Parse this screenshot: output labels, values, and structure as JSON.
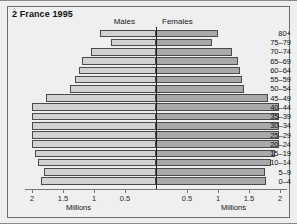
{
  "figure": {
    "title": "2 France 1995",
    "legend": {
      "left": "Males",
      "right": "Females"
    }
  },
  "chart_data": {
    "type": "bar",
    "subtype": "population-pyramid",
    "title": "2 France 1995",
    "xlabel": "Millions",
    "ylabel": "",
    "categories": [
      "0-4",
      "5-9",
      "10-14",
      "15-19",
      "20-24",
      "25-29",
      "30-34",
      "35-39",
      "40-44",
      "45-49",
      "50-54",
      "55-59",
      "60-64",
      "65-69",
      "70-74",
      "75-79",
      "80+"
    ],
    "series": [
      {
        "name": "Males",
        "direction": "left",
        "color": "#d2d2d2",
        "values": [
          1.85,
          1.8,
          1.9,
          1.95,
          2.0,
          2.0,
          2.0,
          2.0,
          2.0,
          1.78,
          1.38,
          1.3,
          1.25,
          1.2,
          1.05,
          0.72,
          0.9
        ]
      },
      {
        "name": "Females",
        "direction": "right",
        "color": "#a9a9a9",
        "values": [
          1.78,
          1.75,
          1.85,
          1.92,
          1.98,
          1.98,
          1.98,
          1.98,
          1.98,
          1.8,
          1.42,
          1.38,
          1.35,
          1.32,
          1.22,
          0.9,
          1.0
        ]
      }
    ],
    "xlim": [
      0,
      2.2
    ],
    "xticks": [
      0.5,
      1,
      1.5,
      2
    ],
    "xticklabels": [
      "0.5",
      "1",
      "1.5",
      "2"
    ],
    "grid": false,
    "legend_position": "top-center"
  },
  "axis": {
    "left_ticks": [
      "2",
      "1.5",
      "1",
      "0.5"
    ],
    "right_ticks": [
      "0.5",
      "1",
      "1.5",
      "2"
    ],
    "unit_left": "Millions",
    "unit_right": "Millions"
  }
}
